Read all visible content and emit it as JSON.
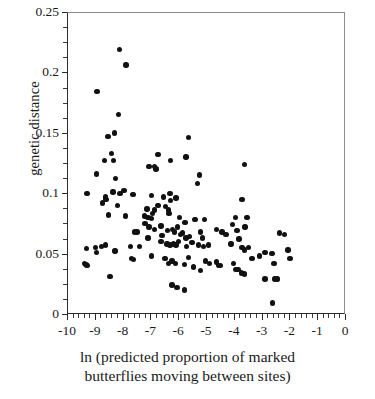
{
  "chart_data": {
    "type": "scatter",
    "title": "",
    "xlabel": "ln (predicted proportion of marked butterflies moving between sites)",
    "xlabel_line1": "ln (predicted proportion of marked",
    "xlabel_line2": "butterflies moving between sites)",
    "ylabel": "genetic distance",
    "xlim": [
      -10,
      0
    ],
    "ylim": [
      0,
      0.25
    ],
    "xticks": [
      -10,
      -9,
      -8,
      -7,
      -6,
      -5,
      -4,
      -3,
      -2,
      -1,
      0
    ],
    "xticklabels": [
      "-10",
      "-9",
      "-8",
      "-7",
      "-6",
      "-5",
      "-4",
      "-3",
      "-2",
      "-1",
      "0"
    ],
    "xminor_step": 0.2,
    "yticks": [
      0,
      0.05,
      0.1,
      0.15,
      0.2,
      0.25
    ],
    "yticklabels": [
      "0",
      "0.05",
      "0.1",
      "0.15",
      "0.2",
      "0.25"
    ],
    "yminor_step": 0.0125,
    "grid": false,
    "legend": null,
    "marker": "filled-circle",
    "marker_color": "#111111",
    "marker_size_px": 5.4,
    "n_points": 142,
    "points": [
      [
        -8.12,
        0.219
      ],
      [
        -7.88,
        0.206
      ],
      [
        -8.92,
        0.184
      ],
      [
        -8.15,
        0.165
      ],
      [
        -8.3,
        0.15
      ],
      [
        -8.53,
        0.147
      ],
      [
        -5.63,
        0.146
      ],
      [
        -8.4,
        0.133
      ],
      [
        -6.72,
        0.132
      ],
      [
        -8.65,
        0.127
      ],
      [
        -8.32,
        0.127
      ],
      [
        -6.27,
        0.127
      ],
      [
        -5.72,
        0.13
      ],
      [
        -3.62,
        0.124
      ],
      [
        -7.05,
        0.122
      ],
      [
        -6.85,
        0.122
      ],
      [
        -6.8,
        0.12
      ],
      [
        -8.93,
        0.116
      ],
      [
        -5.23,
        0.115
      ],
      [
        -5.3,
        0.108
      ],
      [
        -8.25,
        0.112
      ],
      [
        -9.28,
        0.1
      ],
      [
        -8.35,
        0.101
      ],
      [
        -8.1,
        0.1
      ],
      [
        -8.62,
        0.097
      ],
      [
        -8.6,
        0.095
      ],
      [
        -7.95,
        0.102
      ],
      [
        -7.62,
        0.099
      ],
      [
        -6.97,
        0.098
      ],
      [
        -6.52,
        0.097
      ],
      [
        -6.3,
        0.1
      ],
      [
        -6.28,
        0.094
      ],
      [
        -6.08,
        0.096
      ],
      [
        -3.7,
        0.095
      ],
      [
        -8.72,
        0.092
      ],
      [
        -8.18,
        0.09
      ],
      [
        -6.73,
        0.09
      ],
      [
        -8.5,
        0.082
      ],
      [
        -7.9,
        0.081
      ],
      [
        -7.12,
        0.087
      ],
      [
        -6.85,
        0.086
      ],
      [
        -6.45,
        0.089
      ],
      [
        -6.35,
        0.086
      ],
      [
        -6.33,
        0.083
      ],
      [
        -7.22,
        0.081
      ],
      [
        -7.08,
        0.08
      ],
      [
        -6.95,
        0.079
      ],
      [
        -6.92,
        0.083
      ],
      [
        -5.95,
        0.08
      ],
      [
        -5.75,
        0.076
      ],
      [
        -5.4,
        0.078
      ],
      [
        -5.05,
        0.078
      ],
      [
        -3.95,
        0.08
      ],
      [
        -3.52,
        0.08
      ],
      [
        -7.2,
        0.075
      ],
      [
        -7.05,
        0.072
      ],
      [
        -6.62,
        0.073
      ],
      [
        -6.38,
        0.069
      ],
      [
        -6.2,
        0.07
      ],
      [
        -6.13,
        0.068
      ],
      [
        -6.02,
        0.072
      ],
      [
        -5.92,
        0.066
      ],
      [
        -5.85,
        0.067
      ],
      [
        -5.72,
        0.063
      ],
      [
        -7.58,
        0.068
      ],
      [
        -7.48,
        0.068
      ],
      [
        -6.85,
        0.07
      ],
      [
        -6.58,
        0.065
      ],
      [
        -5.6,
        0.064
      ],
      [
        -5.2,
        0.068
      ],
      [
        -5.12,
        0.063
      ],
      [
        -4.62,
        0.07
      ],
      [
        -4.42,
        0.068
      ],
      [
        -4.28,
        0.066
      ],
      [
        -4.05,
        0.074
      ],
      [
        -3.88,
        0.069
      ],
      [
        -3.6,
        0.072
      ],
      [
        -2.35,
        0.067
      ],
      [
        -2.18,
        0.066
      ],
      [
        -6.62,
        0.06
      ],
      [
        -6.4,
        0.058
      ],
      [
        -6.3,
        0.057
      ],
      [
        -6.18,
        0.058
      ],
      [
        -6.08,
        0.057
      ],
      [
        -5.98,
        0.06
      ],
      [
        -5.7,
        0.056
      ],
      [
        -5.5,
        0.059
      ],
      [
        -5.28,
        0.057
      ],
      [
        -5.1,
        0.056
      ],
      [
        -4.92,
        0.057
      ],
      [
        -4.1,
        0.058
      ],
      [
        -3.82,
        0.062
      ],
      [
        -3.7,
        0.055
      ],
      [
        -3.62,
        0.053
      ],
      [
        -3.48,
        0.055
      ],
      [
        -2.05,
        0.053
      ],
      [
        -9.3,
        0.054
      ],
      [
        -8.98,
        0.055
      ],
      [
        -8.75,
        0.056
      ],
      [
        -8.62,
        0.057
      ],
      [
        -8.95,
        0.051
      ],
      [
        -8.28,
        0.052
      ],
      [
        -7.72,
        0.056
      ],
      [
        -7.4,
        0.056
      ],
      [
        -7.08,
        0.063
      ],
      [
        -2.88,
        0.051
      ],
      [
        -2.62,
        0.05
      ],
      [
        -1.98,
        0.046
      ],
      [
        -9.38,
        0.042
      ],
      [
        -9.32,
        0.041
      ],
      [
        -9.28,
        0.04
      ],
      [
        -7.68,
        0.046
      ],
      [
        -7.6,
        0.045
      ],
      [
        -6.95,
        0.048
      ],
      [
        -6.48,
        0.046
      ],
      [
        -6.35,
        0.042
      ],
      [
        -6.22,
        0.044
      ],
      [
        -6.1,
        0.042
      ],
      [
        -5.78,
        0.041
      ],
      [
        -5.62,
        0.047
      ],
      [
        -5.45,
        0.039
      ],
      [
        -5.2,
        0.036
      ],
      [
        -5.02,
        0.044
      ],
      [
        -4.88,
        0.042
      ],
      [
        -4.62,
        0.043
      ],
      [
        -4.55,
        0.04
      ],
      [
        -4.48,
        0.04
      ],
      [
        -4.02,
        0.042
      ],
      [
        -3.92,
        0.037
      ],
      [
        -3.85,
        0.037
      ],
      [
        -3.72,
        0.034
      ],
      [
        -3.62,
        0.033
      ],
      [
        -3.35,
        0.046
      ],
      [
        -3.08,
        0.048
      ],
      [
        -2.55,
        0.042
      ],
      [
        -8.45,
        0.031
      ],
      [
        -2.88,
        0.029
      ],
      [
        -2.52,
        0.029
      ],
      [
        -2.42,
        0.029
      ],
      [
        -6.22,
        0.024
      ],
      [
        -6.05,
        0.022
      ],
      [
        -5.78,
        0.02
      ],
      [
        -2.6,
        0.009
      ]
    ]
  }
}
